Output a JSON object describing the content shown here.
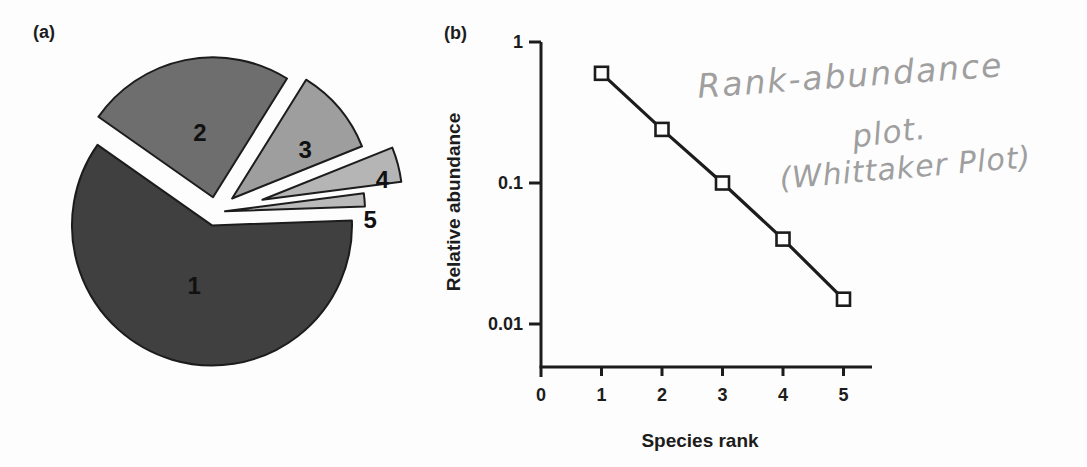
{
  "figure": {
    "panel_a_label": "(a)",
    "panel_b_label": "(b)",
    "ink_color": "#1c1c1c",
    "background": "#fdfdfd"
  },
  "annotation": {
    "style": "handwritten-pencil",
    "color": "#9f9f9f",
    "lines": [
      "Rank-abundance",
      "plot.",
      "(Whittaker Plot)"
    ]
  },
  "chart_data": [
    {
      "type": "pie",
      "panel": "(a)",
      "exploded": true,
      "categories": [
        "1",
        "2",
        "3",
        "4",
        "5"
      ],
      "values": [
        0.6,
        0.24,
        0.1,
        0.04,
        0.015
      ],
      "slice_colors": [
        "#404040",
        "#6e6e6e",
        "#9e9e9e",
        "#b5b5b5",
        "#bababa"
      ],
      "outline_color": "#1c1c1c",
      "label_color": "#111111"
    },
    {
      "type": "line",
      "panel": "(b)",
      "x": [
        1,
        2,
        3,
        4,
        5
      ],
      "y": [
        0.6,
        0.24,
        0.1,
        0.04,
        0.015
      ],
      "xlabel": "Species rank",
      "ylabel": "Relative abundance",
      "yscale": "log",
      "xticks": [
        0,
        1,
        2,
        3,
        4,
        5
      ],
      "ytick_labels": [
        "1",
        "0.1",
        "0.01"
      ],
      "ytick_values": [
        1,
        0.1,
        0.01
      ],
      "xlim": [
        0,
        5.5
      ],
      "ylim": [
        0.004,
        1
      ],
      "grid": false,
      "legend": "none",
      "marker": "open-square",
      "marker_size": 13,
      "line_color": "#1c1c1c"
    }
  ]
}
